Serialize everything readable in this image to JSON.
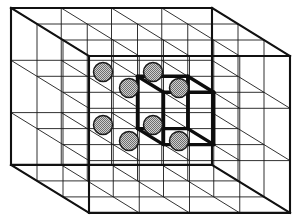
{
  "figure": {
    "kind": "3d-lattice-diagram",
    "background_color": "#ffffff",
    "line_color": "#1a1a1a",
    "bold_line_color": "#0d0d0d",
    "atom_fill_color": "#b3b3b3",
    "atom_stroke_color": "#1a1a1a",
    "atom_radius": 9.5,
    "caption": ""
  },
  "lattice": {
    "description": "Simple cubic point lattice drawn in oblique projection",
    "columns": 4,
    "rows": 3,
    "layers": 3,
    "cell_size_x": 50.25,
    "cell_size_y": 52.3,
    "depth_step_x": 26.0,
    "depth_step_y": 16.0,
    "origin_x": 11,
    "origin_y": 8,
    "outer_box": {
      "back_top_left": [
        11,
        8
      ],
      "back_top_right": [
        212,
        8
      ],
      "back_bottom_right": [
        212,
        165
      ],
      "back_bottom_left": [
        11,
        165
      ],
      "front_top_left": [
        89,
        56
      ],
      "front_top_right": [
        290,
        56
      ],
      "front_bottom_right": [
        290,
        213
      ],
      "front_bottom_left": [
        89,
        213
      ]
    }
  },
  "unit_cell": {
    "label": "unit cell",
    "highlighted": true,
    "grid_index_origin": [
      2,
      1,
      1
    ],
    "vertices": [
      {
        "name": "back-top-left",
        "x": 103,
        "y": 72
      },
      {
        "name": "back-top-right",
        "x": 153,
        "y": 72
      },
      {
        "name": "back-bottom-left",
        "x": 103,
        "y": 125
      },
      {
        "name": "back-bottom-right",
        "x": 153,
        "y": 125
      },
      {
        "name": "front-top-left",
        "x": 129,
        "y": 88
      },
      {
        "name": "front-top-right",
        "x": 179,
        "y": 88
      },
      {
        "name": "front-bottom-left",
        "x": 129,
        "y": 141
      },
      {
        "name": "front-bottom-right",
        "x": 179,
        "y": 141
      }
    ],
    "atom_count": 8,
    "edge_count": 12
  }
}
